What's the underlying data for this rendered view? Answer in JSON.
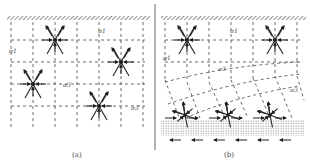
{
  "figure": {
    "panels": [
      {
        "id": "a",
        "caption": "(a)",
        "labels": {
          "sigma1_top": "σ1",
          "sigma1_left": "σ1",
          "sigma3_mid": "σ3",
          "sigma3_right": "σ3"
        },
        "description": "Uniform stress field: orthogonal grid of stress trajectories below a rigid upper boundary with conjugate fracture/stress crosses"
      },
      {
        "id": "b",
        "caption": "(b)",
        "labels": {
          "sigma1_top": "σ1",
          "sigma1_left": "σ1",
          "sigma3_mid": "σ3",
          "sigma3_right": "σ3"
        },
        "description": "Stress field perturbed near a sheared basal layer: trajectories curve toward the basal dotted layer with shear arrows"
      }
    ],
    "colors": {
      "line": "#333333",
      "hatch": "#555555",
      "background": "#ffffff"
    }
  }
}
